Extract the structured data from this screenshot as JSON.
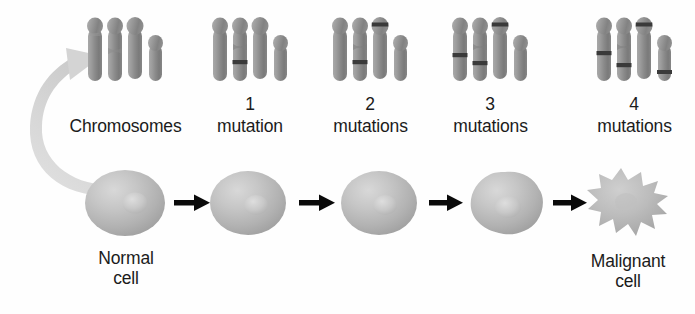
{
  "figure": {
    "background_color": "#fefefe",
    "text_color": "#1b1b1b",
    "chromosome_color": "#8e8e8e",
    "chromosome_band_color": "#3a3a3a",
    "cell_color": "#b4b4b4",
    "arrow_color": "#0a0a0a",
    "curved_arrow_color": "#d2d2d2"
  },
  "chromosome_stages": [
    {
      "id": "stage-0",
      "caption_count": "",
      "caption_label": "Chromosomes",
      "mutation_count": 0,
      "banded_chromosomes": []
    },
    {
      "id": "stage-1",
      "caption_count": "1",
      "caption_label": "mutation",
      "mutation_count": 1,
      "banded_chromosomes": [
        2
      ]
    },
    {
      "id": "stage-2",
      "caption_count": "2",
      "caption_label": "mutations",
      "mutation_count": 2,
      "banded_chromosomes": [
        2,
        3
      ]
    },
    {
      "id": "stage-3",
      "caption_count": "3",
      "caption_label": "mutations",
      "mutation_count": 3,
      "banded_chromosomes": [
        1,
        2,
        3
      ]
    },
    {
      "id": "stage-4",
      "caption_count": "4",
      "caption_label": "mutations",
      "mutation_count": 4,
      "banded_chromosomes": [
        1,
        2,
        3,
        4
      ]
    }
  ],
  "cells": [
    {
      "id": "cell-normal",
      "caption": "Normal\ncell",
      "shape": "round",
      "has_caption": true
    },
    {
      "id": "cell-stage-1",
      "caption": "",
      "shape": "round",
      "has_caption": false
    },
    {
      "id": "cell-stage-2",
      "caption": "",
      "shape": "round",
      "has_caption": false
    },
    {
      "id": "cell-stage-3",
      "caption": "",
      "shape": "lumpy",
      "has_caption": false
    },
    {
      "id": "cell-malignant",
      "caption": "Malignant\ncell",
      "shape": "spiky",
      "has_caption": true
    }
  ],
  "arrows": [
    {
      "id": "arrow-1",
      "from": "cell-normal",
      "to": "cell-stage-1"
    },
    {
      "id": "arrow-2",
      "from": "cell-stage-1",
      "to": "cell-stage-2"
    },
    {
      "id": "arrow-3",
      "from": "cell-stage-2",
      "to": "cell-stage-3"
    },
    {
      "id": "arrow-4",
      "from": "cell-stage-3",
      "to": "cell-malignant"
    }
  ],
  "curved_arrow": {
    "id": "magnify-arrow",
    "from": "cell-normal",
    "to": "stage-0",
    "description": "curved arrow from normal cell up to chromosome set"
  }
}
